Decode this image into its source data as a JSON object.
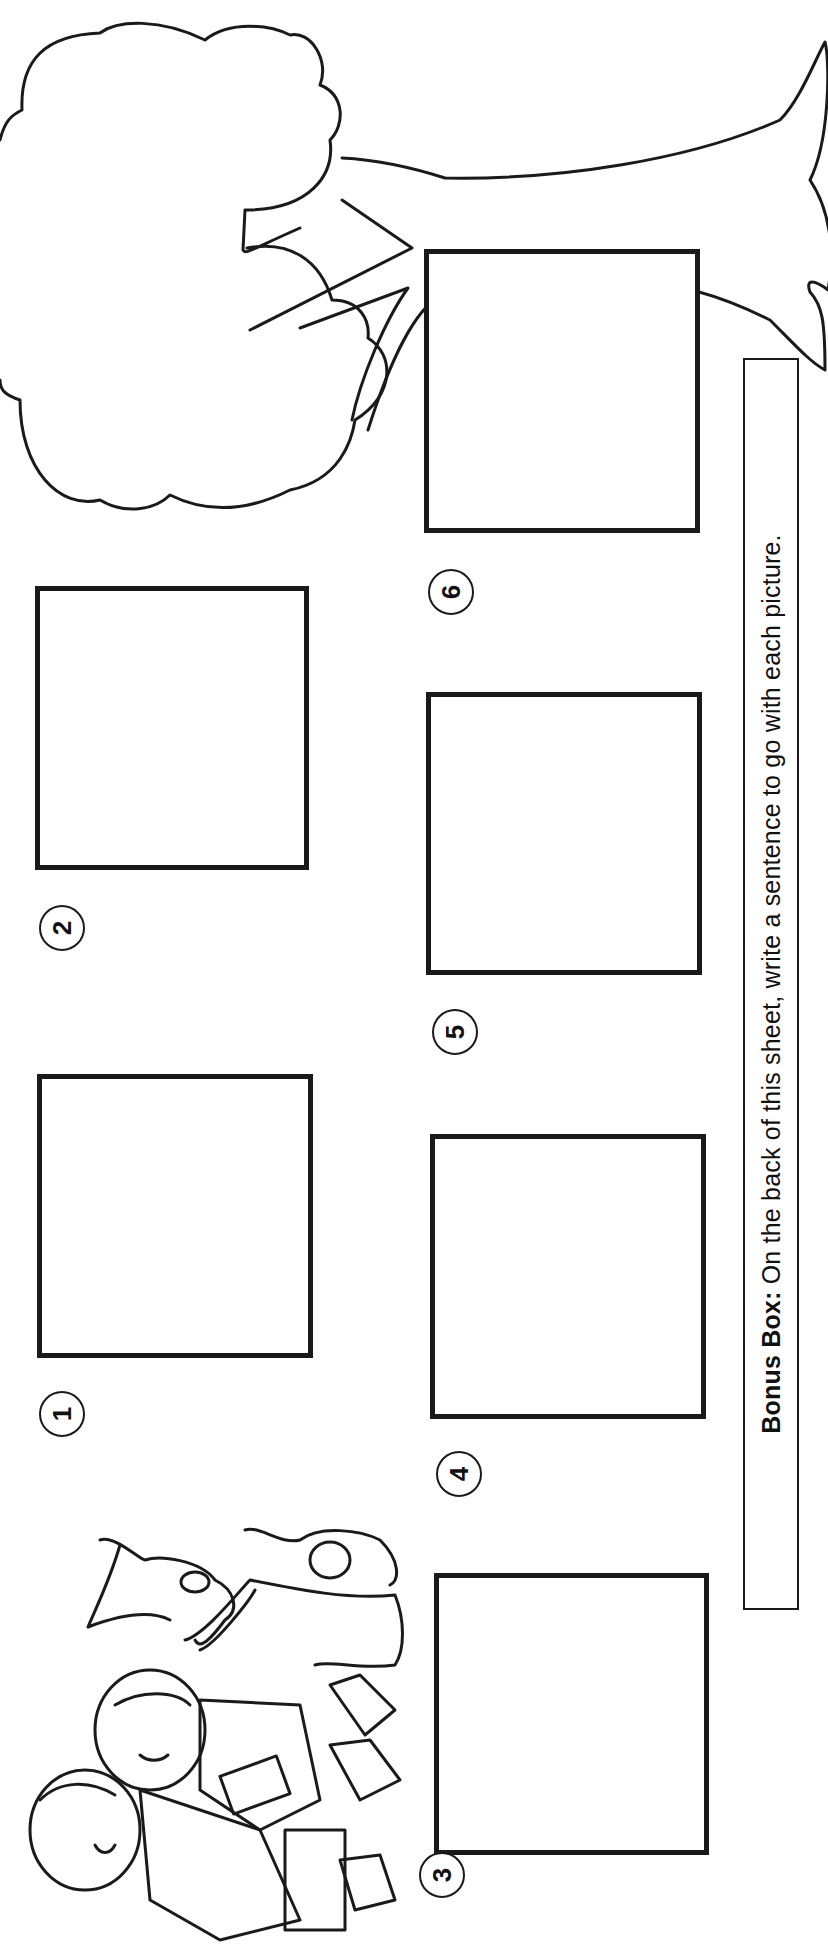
{
  "worksheet": {
    "orientation": "rotated-90-ccw",
    "frames": [
      {
        "number": "1",
        "label": "1"
      },
      {
        "number": "2",
        "label": "2"
      },
      {
        "number": "3",
        "label": "3"
      },
      {
        "number": "4",
        "label": "4"
      },
      {
        "number": "5",
        "label": "5"
      },
      {
        "number": "6",
        "label": "6"
      }
    ],
    "bonus_box": {
      "label": "Bonus Box:",
      "text": " On the back of this sheet, write a sentence to go with each picture."
    },
    "illustrations": {
      "tree": "tree-outline",
      "kids": "two-children-with-dog-and-cat"
    },
    "colors": {
      "ink": "#1a1a1a",
      "paper": "#ffffff"
    }
  }
}
